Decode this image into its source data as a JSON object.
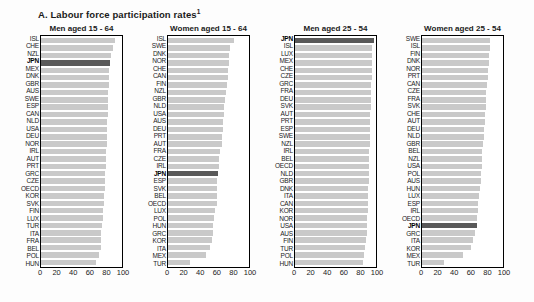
{
  "title": "A. Labour force participation rates",
  "title_superscript": "1",
  "highlight_country": "JPN",
  "colors": {
    "bar": "#c9c9c9",
    "highlight_bar": "#595959",
    "frame": "#000000",
    "background": "#fdfdfd"
  },
  "axis": {
    "ticks": [
      "0",
      "20",
      "40",
      "60",
      "80",
      "100"
    ],
    "min": 0,
    "max": 100
  },
  "chart_data": [
    {
      "type": "bar",
      "orientation": "horizontal",
      "title": "Men aged 15 - 64",
      "xlim": [
        0,
        100
      ],
      "categories": [
        "ISL",
        "CHE",
        "NZL",
        "JPN",
        "MEX",
        "DNK",
        "GBR",
        "AUS",
        "SWE",
        "ESP",
        "CAN",
        "NLD",
        "USA",
        "DEU",
        "NOR",
        "IRL",
        "AUT",
        "PRT",
        "GRC",
        "CZE",
        "OECD",
        "KOR",
        "SVK",
        "FIN",
        "LUX",
        "TUR",
        "ITA",
        "FRA",
        "BEL",
        "POL",
        "HUN"
      ],
      "values": [
        91.5,
        88.5,
        86,
        85.5,
        84.5,
        84,
        83.5,
        83,
        83,
        82.5,
        82.5,
        82,
        81.5,
        81.5,
        81,
        80.5,
        80.5,
        80,
        79.5,
        79,
        78.5,
        78,
        77.5,
        77,
        76.5,
        75.5,
        74.5,
        74,
        73.5,
        71,
        68
      ]
    },
    {
      "type": "bar",
      "orientation": "horizontal",
      "title": "Women aged 15 - 64",
      "xlim": [
        0,
        100
      ],
      "categories": [
        "ISL",
        "SWE",
        "DNK",
        "NOR",
        "CHE",
        "CAN",
        "FIN",
        "NZL",
        "GBR",
        "NLD",
        "USA",
        "AUS",
        "DEU",
        "PRT",
        "AUT",
        "FRA",
        "CZE",
        "IRL",
        "JPN",
        "ESP",
        "SVK",
        "BEL",
        "OECD",
        "LUX",
        "POL",
        "HUN",
        "GRC",
        "KOR",
        "ITA",
        "MEX",
        "TUR"
      ],
      "values": [
        82,
        76,
        75.5,
        75,
        74.5,
        74,
        73,
        72,
        70,
        69.5,
        69,
        68.5,
        68,
        67,
        66.5,
        64.5,
        63,
        62.5,
        61.5,
        61,
        60.5,
        60,
        60,
        58,
        57,
        55.5,
        55,
        54.5,
        52,
        47,
        27
      ]
    },
    {
      "type": "bar",
      "orientation": "horizontal",
      "title": "Men aged 25 - 54",
      "xlim": [
        0,
        100
      ],
      "categories": [
        "JPN",
        "ISL",
        "LUX",
        "MEX",
        "CHE",
        "CZE",
        "GRC",
        "FRA",
        "DEU",
        "SVK",
        "AUT",
        "PRT",
        "ESP",
        "SWE",
        "NZL",
        "IRL",
        "BEL",
        "OECD",
        "NLD",
        "GBR",
        "DNK",
        "ITA",
        "CAN",
        "KOR",
        "NOR",
        "USA",
        "AUS",
        "FIN",
        "TUR",
        "POL",
        "HUN"
      ],
      "values": [
        97,
        95.5,
        95,
        95,
        94.5,
        94.5,
        94,
        94,
        93.5,
        93.5,
        93,
        92.5,
        92.5,
        92,
        92,
        91.5,
        91.5,
        91,
        91,
        91,
        90.5,
        90.5,
        90,
        90,
        89.5,
        89,
        89,
        88,
        87,
        85.5,
        83.5
      ]
    },
    {
      "type": "bar",
      "orientation": "horizontal",
      "title": "Women aged 25 - 54",
      "xlim": [
        0,
        100
      ],
      "categories": [
        "SWE",
        "ISL",
        "FIN",
        "DNK",
        "NOR",
        "PRT",
        "CAN",
        "CZE",
        "FRA",
        "SVK",
        "CHE",
        "AUT",
        "DEU",
        "NLD",
        "GBR",
        "BEL",
        "NZL",
        "USA",
        "POL",
        "AUS",
        "HUN",
        "LUX",
        "ESP",
        "IRL",
        "OECD",
        "JPN",
        "GRC",
        "ITA",
        "KOR",
        "MEX",
        "TUR"
      ],
      "values": [
        84.5,
        84,
        83,
        82.5,
        82,
        81,
        80.5,
        79.5,
        79,
        78.5,
        78,
        77.5,
        77,
        76.5,
        75.5,
        74.5,
        74,
        73.5,
        73,
        72.5,
        71.5,
        70.5,
        69.5,
        69,
        68.5,
        68,
        66,
        63,
        60,
        50.5,
        27.5
      ]
    }
  ]
}
